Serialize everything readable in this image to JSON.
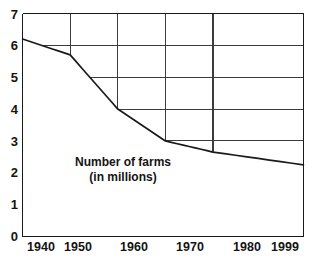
{
  "chart_data": {
    "type": "line",
    "title": "",
    "xlabel": "",
    "ylabel": "",
    "x": [
      1940,
      1950,
      1960,
      1970,
      1980,
      1999
    ],
    "categories": [
      "1940",
      "1950",
      "1960",
      "1970",
      "1980",
      "1999"
    ],
    "values": [
      6.2,
      5.7,
      4.0,
      3.0,
      2.65,
      2.25
    ],
    "series": [
      {
        "name": "Number of farms (in millions)",
        "values": [
          6.2,
          5.7,
          4.0,
          3.0,
          2.65,
          2.25
        ]
      }
    ],
    "xlim": [
      1940,
      1999
    ],
    "ylim": [
      0,
      7
    ],
    "ytick_labels": [
      "0",
      "1",
      "2",
      "3",
      "4",
      "5",
      "6",
      "7"
    ],
    "ytick_values": [
      0,
      1,
      2,
      3,
      4,
      5,
      6,
      7
    ],
    "xtick_labels": [
      "1940",
      "1950",
      "1960",
      "1970",
      "1980",
      "1999"
    ],
    "xtick_values": [
      1940,
      1950,
      1960,
      1970,
      1980,
      1999
    ],
    "grid": true,
    "legend": "none",
    "annotations": [
      {
        "line1": "Number of farms",
        "line2": "(in millions)"
      }
    ],
    "colors": {
      "line": "#1a1a1a",
      "grid": "#3c3c3c",
      "axis": "#1a1a1a",
      "background": "#ffffff",
      "text": "#141414"
    }
  },
  "annotation": {
    "line1": "Number of farms",
    "line2": "(in millions)"
  },
  "axes": {
    "y": {
      "t7": "7",
      "t6": "6",
      "t5": "5",
      "t4": "4",
      "t3": "3",
      "t2": "2",
      "t1": "1",
      "t0": "0"
    },
    "x": {
      "t1940": "1940",
      "t1950": "1950",
      "t1960": "1960",
      "t1970": "1970",
      "t1980": "1980",
      "t1999": "1999"
    }
  }
}
